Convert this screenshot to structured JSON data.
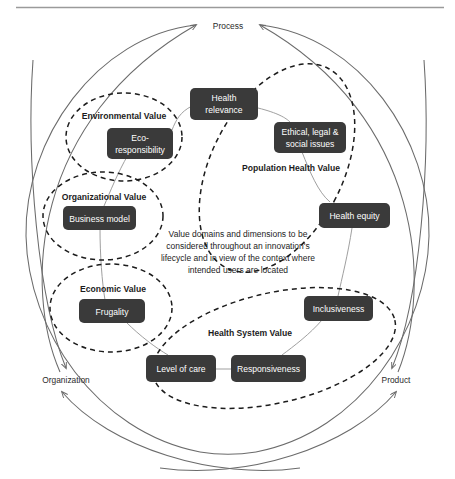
{
  "figure": {
    "title_rule": true,
    "center_note": {
      "lines": [
        "Value domains and dimensions to be",
        "considered throughout an innovation's",
        "lifecycle and in view of the context where",
        "intended users are located"
      ]
    },
    "axis_labels": [
      {
        "name": "process",
        "text": "Process"
      },
      {
        "name": "organization",
        "text": "Organization"
      },
      {
        "name": "product",
        "text": "Product"
      }
    ],
    "domains": [
      {
        "id": "environmental",
        "label": "Environmental Value"
      },
      {
        "id": "organizational",
        "label": "Organizational Value"
      },
      {
        "id": "economic",
        "label": "Economic Value"
      },
      {
        "id": "population-health",
        "label": "Population Health Value"
      },
      {
        "id": "health-system",
        "label": "Health System Value"
      }
    ],
    "dimensions": [
      {
        "id": "health-relevance",
        "domain": "population-health",
        "lines": [
          "Health",
          "relevance"
        ]
      },
      {
        "id": "ethical-legal-social",
        "domain": "population-health",
        "lines": [
          "Ethical, legal &",
          "social issues"
        ]
      },
      {
        "id": "health-equity",
        "domain": "population-health",
        "lines": [
          "Health equity"
        ]
      },
      {
        "id": "eco-responsibility",
        "domain": "environmental",
        "lines": [
          "Eco-",
          "responsibility"
        ]
      },
      {
        "id": "business-model",
        "domain": "organizational",
        "lines": [
          "Business model"
        ]
      },
      {
        "id": "frugality",
        "domain": "economic",
        "lines": [
          "Frugality"
        ]
      },
      {
        "id": "inclusiveness",
        "domain": "health-system",
        "lines": [
          "Inclusiveness"
        ]
      },
      {
        "id": "level-of-care",
        "domain": "health-system",
        "lines": [
          "Level of care"
        ]
      },
      {
        "id": "responsiveness",
        "domain": "health-system",
        "lines": [
          "Responsiveness"
        ]
      }
    ],
    "colors": {
      "node_fill": "#3a3a3a",
      "node_text": "#ffffff",
      "outline": "#6b6b6b",
      "dashed_outline": "#1c1c1c",
      "connector": "#8a8a8a",
      "rule": "#9a9a9a",
      "text": "#1c1c1c"
    }
  }
}
